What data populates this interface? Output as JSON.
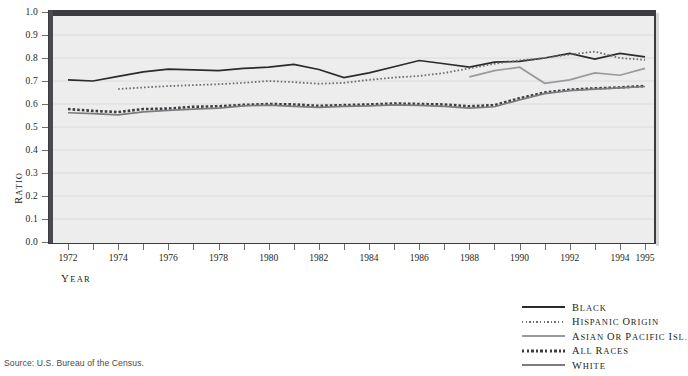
{
  "source_note": "Source: U.S. Bureau of the Census.",
  "axes": {
    "ylabel": "Ratio",
    "xlabel": "Year",
    "yticks": [
      "0.0",
      "0.1",
      "0.2",
      "0.3",
      "0.4",
      "0.5",
      "0.6",
      "0.7",
      "0.8",
      "0.9",
      "1.0"
    ],
    "xticks": [
      "1972",
      "1974",
      "1976",
      "1978",
      "1980",
      "1982",
      "1984",
      "1986",
      "1988",
      "1990",
      "1992",
      "1994",
      "1995"
    ]
  },
  "legend": {
    "items": [
      {
        "label": "Black",
        "style": "solid",
        "color": "#2b2b2f",
        "key": "black"
      },
      {
        "label": "Hispanic Origin",
        "style": "fine-dotted",
        "color": "#6e6e72",
        "key": "hispanic"
      },
      {
        "label": "Asian or Pacific Isl.",
        "style": "solid",
        "color": "#9a9a9e",
        "key": "asian"
      },
      {
        "label": "All Races",
        "style": "bold-dotted",
        "color": "#3d3d41",
        "key": "all"
      },
      {
        "label": "White",
        "style": "solid",
        "color": "#7c7c80",
        "key": "white"
      }
    ]
  },
  "chart_data": {
    "type": "line",
    "title": "",
    "xlabel": "Year",
    "ylabel": "Ratio",
    "xlim": [
      1972,
      1995
    ],
    "ylim": [
      0.0,
      1.0
    ],
    "grid": true,
    "legend_position": "below-right",
    "x": [
      1972,
      1973,
      1974,
      1975,
      1976,
      1977,
      1978,
      1979,
      1980,
      1981,
      1982,
      1983,
      1984,
      1985,
      1986,
      1987,
      1988,
      1989,
      1990,
      1991,
      1992,
      1993,
      1994,
      1995
    ],
    "series": [
      {
        "name": "Black",
        "color": "#2b2b2f",
        "style": "solid",
        "values": [
          0.705,
          0.7,
          0.72,
          0.74,
          0.752,
          0.748,
          0.745,
          0.755,
          0.76,
          0.772,
          0.75,
          0.715,
          0.735,
          0.762,
          0.789,
          0.775,
          0.76,
          0.782,
          0.785,
          0.8,
          0.82,
          0.795,
          0.82,
          0.805
        ]
      },
      {
        "name": "Hispanic Origin",
        "color": "#6e6e72",
        "style": "fine-dotted",
        "values": [
          null,
          null,
          0.665,
          0.672,
          0.678,
          0.682,
          0.686,
          0.692,
          0.7,
          0.695,
          0.688,
          0.692,
          0.705,
          0.715,
          0.722,
          0.735,
          0.755,
          0.775,
          0.79,
          0.8,
          0.815,
          0.828,
          0.8,
          0.792
        ]
      },
      {
        "name": "Asian or Pacific Isl.",
        "color": "#9a9a9e",
        "style": "solid",
        "values": [
          null,
          null,
          null,
          null,
          null,
          null,
          null,
          null,
          null,
          null,
          null,
          null,
          null,
          null,
          null,
          null,
          0.718,
          0.745,
          0.76,
          0.69,
          0.705,
          0.735,
          0.725,
          0.755
        ]
      },
      {
        "name": "All Races",
        "color": "#3d3d41",
        "style": "bold-dotted",
        "values": [
          0.578,
          0.57,
          0.565,
          0.578,
          0.58,
          0.588,
          0.59,
          0.596,
          0.6,
          0.598,
          0.592,
          0.595,
          0.598,
          0.602,
          0.6,
          0.598,
          0.59,
          0.595,
          0.625,
          0.65,
          0.662,
          0.668,
          0.672,
          0.678
        ]
      },
      {
        "name": "White",
        "color": "#7c7c80",
        "style": "solid",
        "values": [
          0.562,
          0.558,
          0.553,
          0.566,
          0.572,
          0.578,
          0.582,
          0.592,
          0.595,
          0.59,
          0.585,
          0.59,
          0.592,
          0.596,
          0.594,
          0.59,
          0.582,
          0.588,
          0.618,
          0.645,
          0.658,
          0.665,
          0.67,
          0.676
        ]
      }
    ]
  }
}
